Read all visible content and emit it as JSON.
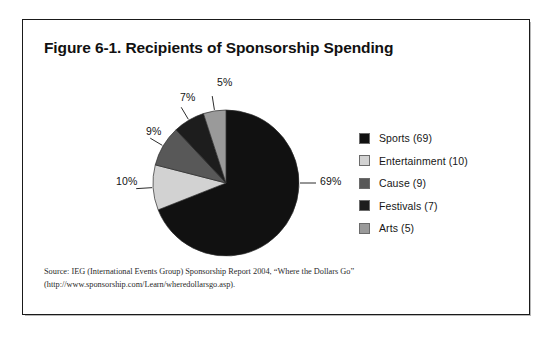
{
  "figure": {
    "title": "Figure 6-1. Recipients of Sponsorship Spending",
    "source_note": "Source: IEG (International Events Group) Sponsorship Report 2004, “Where the Dollars Go” (http://www.sponsorship.com/Learn/wheredollarsgo.asp)."
  },
  "legend": {
    "items": [
      {
        "label": "Sports (69)",
        "color": "#111111",
        "swatch_name": "legend-swatch-sports"
      },
      {
        "label": "Entertainment (10)",
        "color": "#d2d2d2",
        "swatch_name": "legend-swatch-entertainment"
      },
      {
        "label": "Cause (9)",
        "color": "#585858",
        "swatch_name": "legend-swatch-cause"
      },
      {
        "label": "Festivals (7)",
        "color": "#1d1d1d",
        "swatch_name": "legend-swatch-festivals"
      },
      {
        "label": "Arts (5)",
        "color": "#9a9a9a",
        "swatch_name": "legend-swatch-arts"
      }
    ]
  },
  "pie_labels": {
    "sports": "69%",
    "entertainment": "10%",
    "cause": "9%",
    "festivals": "7%",
    "arts": "5%"
  },
  "chart_data": {
    "type": "pie",
    "title": "Figure 6-1. Recipients of Sponsorship Spending",
    "xlabel": "",
    "ylabel": "",
    "legend_position": "right",
    "grid": false,
    "value_unit": "percent",
    "start_angle_deg": 90,
    "direction": "clockwise",
    "categories": [
      "Sports",
      "Entertainment",
      "Cause",
      "Festivals",
      "Arts"
    ],
    "values": [
      69,
      10,
      9,
      7,
      5
    ],
    "labels": [
      "69%",
      "10%",
      "9%",
      "7%",
      "5%"
    ],
    "legend_entries": [
      "Sports (69)",
      "Entertainment (10)",
      "Cause (9)",
      "Festivals (7)",
      "Arts (5)"
    ],
    "colors": [
      "#111111",
      "#d2d2d2",
      "#585858",
      "#1d1d1d",
      "#9a9a9a"
    ],
    "slices": [
      {
        "name": "Sports",
        "value": 69,
        "label": "69%",
        "color": "#111111"
      },
      {
        "name": "Entertainment",
        "value": 10,
        "label": "10%",
        "color": "#d2d2d2"
      },
      {
        "name": "Cause",
        "value": 9,
        "label": "9%",
        "color": "#585858"
      },
      {
        "name": "Festivals",
        "value": 7,
        "label": "7%",
        "color": "#1d1d1d"
      },
      {
        "name": "Arts",
        "value": 5,
        "label": "5%",
        "color": "#9a9a9a"
      }
    ],
    "total": 100,
    "annotations": [
      "Source: IEG (International Events Group) Sponsorship Report 2004, “Where the Dollars Go” (http://www.sponsorship.com/Learn/wheredollarsgo.asp)."
    ]
  }
}
